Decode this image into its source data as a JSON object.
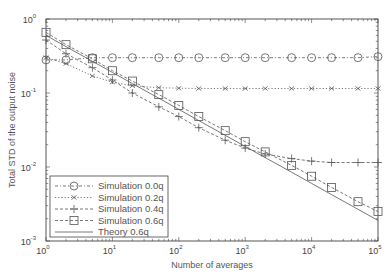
{
  "chart_data": {
    "type": "line",
    "title": "",
    "xlabel": "Number of averages",
    "ylabel": "Total STD of the output noise",
    "xscale": "log",
    "yscale": "log",
    "xlim": [
      1,
      100000
    ],
    "ylim": [
      0.001,
      1
    ],
    "x_ticks": [
      "10^0",
      "10^1",
      "10^2",
      "10^3",
      "10^4",
      "10^5"
    ],
    "y_ticks": [
      "10^-3",
      "10^-2",
      "10^-1",
      "10^0"
    ],
    "grid": false,
    "legend_position": "lower left",
    "x": [
      1,
      2,
      5,
      10,
      20,
      50,
      100,
      200,
      500,
      1000,
      2000,
      5000,
      10000,
      20000,
      50000,
      100000
    ],
    "series": [
      {
        "name": "Simulation 0.0q",
        "marker": "circle",
        "line": "dash-dot",
        "values": [
          0.28,
          0.28,
          0.3,
          0.3,
          0.3,
          0.3,
          0.3,
          0.3,
          0.3,
          0.3,
          0.3,
          0.3,
          0.3,
          0.3,
          0.3,
          0.31
        ]
      },
      {
        "name": "Simulation 0.2q",
        "marker": "x",
        "line": "dotted",
        "values": [
          0.3,
          0.25,
          0.17,
          0.14,
          0.125,
          0.118,
          0.116,
          0.115,
          0.115,
          0.115,
          0.115,
          0.115,
          0.115,
          0.115,
          0.115,
          0.115
        ]
      },
      {
        "name": "Simulation 0.4q",
        "marker": "plus",
        "line": "dashed",
        "values": [
          0.52,
          0.34,
          0.22,
          0.15,
          0.1,
          0.065,
          0.048,
          0.034,
          0.023,
          0.018,
          0.015,
          0.013,
          0.012,
          0.0115,
          0.0115,
          0.0115
        ]
      },
      {
        "name": "Simulation 0.6q",
        "marker": "square",
        "line": "dashed",
        "values": [
          0.66,
          0.45,
          0.29,
          0.2,
          0.145,
          0.095,
          0.068,
          0.048,
          0.031,
          0.022,
          0.016,
          0.0105,
          0.0075,
          0.0053,
          0.0034,
          0.0025
        ]
      },
      {
        "name": "Theory 0.6q",
        "marker": "none",
        "line": "solid",
        "values": [
          0.6,
          0.424,
          0.268,
          0.19,
          0.134,
          0.085,
          0.06,
          0.0424,
          0.0268,
          0.019,
          0.0134,
          0.0085,
          0.006,
          0.00424,
          0.00268,
          0.0019
        ]
      }
    ]
  },
  "axes": {
    "xlabel": "Number of averages",
    "ylabel": "Total STD of the output noise"
  },
  "legend": [
    {
      "label": "Simulation 0.0q"
    },
    {
      "label": "Simulation 0.2q"
    },
    {
      "label": "Simulation 0.4q"
    },
    {
      "label": "Simulation 0.6q"
    },
    {
      "label": "Theory 0.6q"
    }
  ],
  "colors": {
    "line": "#555555",
    "frame": "#444444",
    "background": "#ffffff"
  }
}
